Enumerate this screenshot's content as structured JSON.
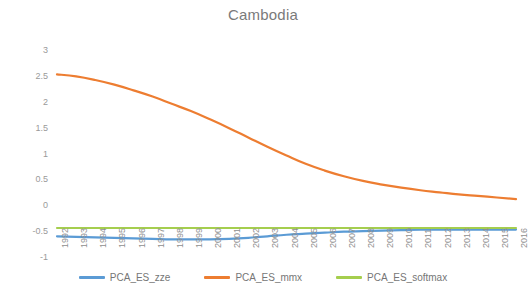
{
  "chart_data": {
    "type": "line",
    "title": "Cambodia",
    "xlabel": "",
    "ylabel": "",
    "ylim": [
      -1,
      3
    ],
    "yticks": [
      "3",
      "2.5",
      "2",
      "1.5",
      "1",
      "0.5",
      "0",
      "-0.5",
      "-1"
    ],
    "ytick_values": [
      3,
      2.5,
      2,
      1.5,
      1,
      0.5,
      0,
      -0.5,
      -1
    ],
    "grid": false,
    "legend_position": "bottom",
    "x": [
      1992,
      1993,
      1994,
      1995,
      1996,
      1997,
      1998,
      1999,
      2000,
      2001,
      2002,
      2003,
      2004,
      2005,
      2006,
      2007,
      2008,
      2009,
      2010,
      2011,
      2012,
      2013,
      2014,
      2015,
      2016
    ],
    "categories": [
      "1992",
      "1993",
      "1994",
      "1995",
      "1996",
      "1997",
      "1998",
      "1999",
      "2000",
      "2001",
      "2002",
      "2003",
      "2004",
      "2005",
      "2006",
      "2007",
      "2008",
      "2009",
      "2010",
      "2011",
      "2012",
      "2013",
      "2014",
      "2015",
      "2016"
    ],
    "series": [
      {
        "name": "PCA_ES_zze",
        "color": "#5B9BD5",
        "values": [
          -0.6,
          -0.61,
          -0.62,
          -0.63,
          -0.64,
          -0.65,
          -0.66,
          -0.66,
          -0.66,
          -0.65,
          -0.63,
          -0.6,
          -0.57,
          -0.55,
          -0.53,
          -0.51,
          -0.5,
          -0.49,
          -0.48,
          -0.47,
          -0.47,
          -0.47,
          -0.47,
          -0.47,
          -0.47
        ]
      },
      {
        "name": "PCA_ES_mmx",
        "color": "#ED7D31",
        "values": [
          2.53,
          2.49,
          2.42,
          2.33,
          2.22,
          2.1,
          1.96,
          1.82,
          1.66,
          1.49,
          1.31,
          1.13,
          0.96,
          0.8,
          0.67,
          0.56,
          0.47,
          0.4,
          0.34,
          0.29,
          0.25,
          0.21,
          0.18,
          0.15,
          0.12
        ]
      },
      {
        "name": "PCA_ES_softmax",
        "color": "#A5CE4E",
        "values": [
          -0.44,
          -0.44,
          -0.44,
          -0.44,
          -0.44,
          -0.44,
          -0.44,
          -0.44,
          -0.44,
          -0.44,
          -0.44,
          -0.44,
          -0.44,
          -0.44,
          -0.44,
          -0.44,
          -0.44,
          -0.44,
          -0.44,
          -0.44,
          -0.44,
          -0.44,
          -0.44,
          -0.44,
          -0.44
        ]
      }
    ]
  },
  "legend": {
    "items": [
      {
        "label": "PCA_ES_zze",
        "color": "#5B9BD5"
      },
      {
        "label": "PCA_ES_mmx",
        "color": "#ED7D31"
      },
      {
        "label": "PCA_ES_softmax",
        "color": "#A5CE4E"
      }
    ]
  }
}
